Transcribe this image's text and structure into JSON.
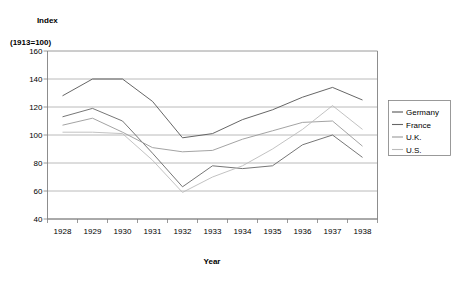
{
  "chart_data": {
    "type": "line",
    "title": "Index",
    "subtitle": "(1913=100)",
    "xlabel": "Year",
    "ylabel": "",
    "categories": [
      "1928",
      "1929",
      "1930",
      "1931",
      "1932",
      "1933",
      "1934",
      "1935",
      "1936",
      "1937",
      "1938"
    ],
    "x": [
      1928,
      1929,
      1930,
      1931,
      1932,
      1933,
      1934,
      1935,
      1936,
      1937,
      1938
    ],
    "ylim": [
      40,
      160
    ],
    "yticks": [
      40,
      60,
      80,
      100,
      120,
      140,
      160
    ],
    "grid": true,
    "legend_position": "right",
    "series": [
      {
        "name": "Germany",
        "color": "#555555",
        "values": [
          128,
          140,
          140,
          124,
          98,
          101,
          111,
          118,
          127,
          134,
          125
        ]
      },
      {
        "name": "France",
        "color": "#666666",
        "values": [
          113,
          119,
          110,
          87,
          63,
          78,
          76,
          78,
          93,
          100,
          84
        ]
      },
      {
        "name": "U.K.",
        "color": "#999999",
        "values": [
          107,
          112,
          102,
          91,
          88,
          89,
          97,
          103,
          109,
          110,
          92
        ]
      },
      {
        "name": "U.S.",
        "color": "#bbbbbb",
        "values": [
          102,
          102,
          101,
          82,
          59,
          70,
          78,
          90,
          104,
          121,
          104
        ]
      }
    ]
  },
  "legend": {
    "items": [
      {
        "label": "Germany"
      },
      {
        "label": "France"
      },
      {
        "label": "U.K."
      },
      {
        "label": "U.S."
      }
    ]
  }
}
